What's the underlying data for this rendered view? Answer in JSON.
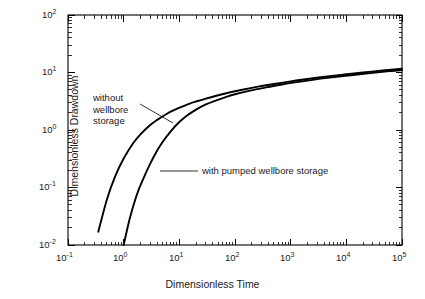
{
  "chart_data": {
    "type": "line",
    "title": "",
    "xlabel": "Dimensionless  Time",
    "ylabel": "Dimensionless  Drawdown",
    "xscale": "log",
    "yscale": "log",
    "xlim": [
      0.1,
      100000
    ],
    "ylim": [
      0.01,
      100
    ],
    "grid": false,
    "legend_position": "inline-annotations",
    "xtick_labels": [
      "10-1",
      "100",
      "101",
      "102",
      "103",
      "104",
      "105"
    ],
    "xtick_mantissa": [
      "10",
      "10",
      "10",
      "10",
      "10",
      "10",
      "10"
    ],
    "xtick_exponents": [
      "-1",
      "0",
      "1",
      "2",
      "3",
      "4",
      "5"
    ],
    "ytick_mantissa": [
      "10",
      "10",
      "10",
      "10",
      "10"
    ],
    "ytick_exponents": [
      "2",
      "1",
      "0",
      "-1",
      "-2"
    ],
    "series": [
      {
        "name": "without wellbore storage",
        "x": [
          0.35,
          0.5,
          0.7,
          1.0,
          1.5,
          2.0,
          3.0,
          4.0,
          6.0,
          8.0,
          10,
          15,
          20,
          30,
          50,
          70,
          100,
          200,
          300,
          500,
          1000,
          2000,
          5000,
          10000,
          20000,
          50000,
          100000
        ],
        "y": [
          0.017,
          0.062,
          0.155,
          0.32,
          0.6,
          0.84,
          1.22,
          1.5,
          1.92,
          2.21,
          2.43,
          2.85,
          3.13,
          3.52,
          4.02,
          4.36,
          4.72,
          5.41,
          5.81,
          6.32,
          7.02,
          7.71,
          8.63,
          9.32,
          10.02,
          10.93,
          11.62
        ]
      },
      {
        "name": "with pumped wellbore storage",
        "x": [
          1.0,
          1.3,
          1.7,
          2.2,
          3.0,
          4.0,
          5.0,
          7.0,
          10,
          14,
          20,
          30,
          45,
          70,
          100,
          150,
          250,
          400,
          700,
          1200,
          2500,
          5000,
          12000,
          30000,
          60000,
          100000
        ],
        "y": [
          0.01,
          0.03,
          0.072,
          0.135,
          0.26,
          0.44,
          0.62,
          0.95,
          1.38,
          1.8,
          2.26,
          2.78,
          3.25,
          3.78,
          4.18,
          4.6,
          5.13,
          5.6,
          6.18,
          6.72,
          7.46,
          8.13,
          8.96,
          9.85,
          10.55,
          11.05
        ]
      }
    ],
    "annotations": [
      {
        "id": "annot-without",
        "lines": [
          "without",
          "wellbore",
          "storage"
        ],
        "text": "without wellbore storage",
        "leader_from": [
          140,
          104
        ],
        "leader_to": [
          173,
          123
        ]
      },
      {
        "id": "annot-with",
        "lines": [
          "with pumped wellbore storage"
        ],
        "text": "with pumped wellbore storage",
        "leader_from": [
          198,
          171
        ],
        "leader_to": [
          160,
          171
        ]
      }
    ],
    "colors": {
      "curve": "#000000",
      "axis": "#000000",
      "text": "#1a1a1a",
      "background": "#ffffff"
    }
  }
}
